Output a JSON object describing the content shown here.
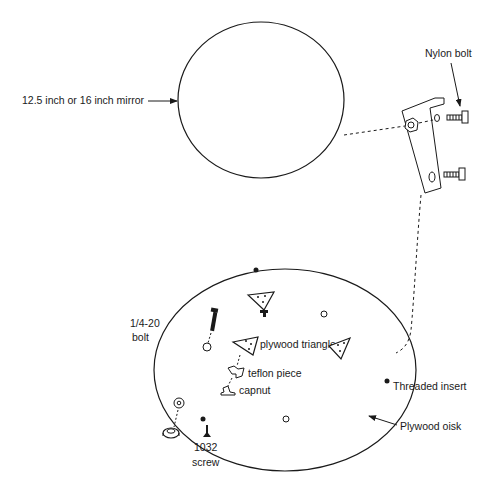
{
  "diagram": {
    "labels": {
      "mirror": "12.5 inch or 16 inch mirror",
      "nylon_bolt": "Nylon bolt",
      "bolt_size": "1/4-20",
      "bolt_word": "bolt",
      "plywood_triangle": "plywood triangle",
      "teflon_piece": "teflon piece",
      "capnut": "capnut",
      "threaded_insert": "Threaded insert",
      "plywood_disk": "Plywood oisk",
      "screw_size": "1032",
      "screw_word": "screw"
    },
    "colors": {
      "line": "#1a1a1a",
      "background": "#ffffff"
    }
  }
}
